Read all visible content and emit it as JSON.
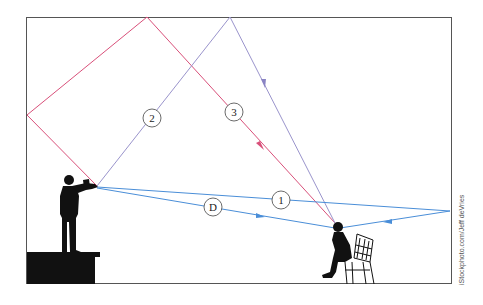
{
  "diagram": {
    "colors": {
      "frame": "#555555",
      "path_red": "#d9507a",
      "path_purple": "#9a94cc",
      "path_blue": "#4a8ed8",
      "silhouette": "#111111"
    },
    "labels": {
      "path_1": "1",
      "path_2": "2",
      "path_3": "3",
      "path_direct": "D"
    },
    "credit": "iStockphoto.com/Jeff deVries"
  }
}
